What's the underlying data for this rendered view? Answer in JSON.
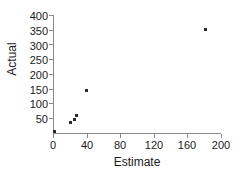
{
  "chart_data": {
    "type": "scatter",
    "title": "",
    "xlabel": "Estimate",
    "ylabel": "Actual",
    "xlim": [
      0,
      200
    ],
    "ylim": [
      0,
      400
    ],
    "xticks": [
      0,
      40,
      80,
      120,
      160,
      200
    ],
    "yticks": [
      0,
      50,
      100,
      150,
      200,
      250,
      300,
      350,
      400
    ],
    "xtick_labels": [
      "0",
      "40",
      "80",
      "120",
      "160",
      "200"
    ],
    "ytick_labels": [
      "",
      "50",
      "100",
      "150",
      "200",
      "250",
      "300",
      "350",
      "400"
    ],
    "grid": false,
    "legend": null,
    "marker": "square",
    "marker_color": "#2b2b2b",
    "axis_color": "#8a8a8a",
    "points": [
      {
        "x": 2,
        "y": 5
      },
      {
        "x": 21,
        "y": 35
      },
      {
        "x": 25,
        "y": 47
      },
      {
        "x": 28,
        "y": 60
      },
      {
        "x": 40,
        "y": 145
      },
      {
        "x": 182,
        "y": 350
      }
    ]
  }
}
